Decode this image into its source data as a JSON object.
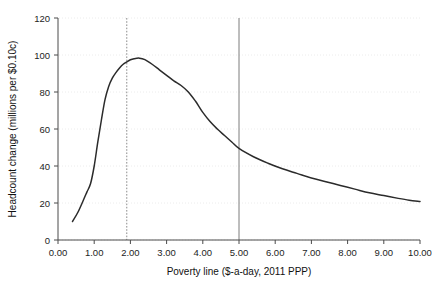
{
  "chart_data": {
    "type": "line",
    "title": "",
    "subtitle": "",
    "xlabel": "Poverty line ($-a-day, 2011 PPP)",
    "ylabel": "Headcount change  (millions per $0.10c)",
    "xlim": [
      0.0,
      10.0
    ],
    "ylim": [
      0,
      120
    ],
    "xticks": [
      0.0,
      1.0,
      2.0,
      3.0,
      4.0,
      5.0,
      6.0,
      7.0,
      8.0,
      9.0,
      10.0
    ],
    "xtick_labels": [
      "0.00",
      "1.00",
      "2.00",
      "3.00",
      "4.00",
      "5.00",
      "6.00",
      "7.00",
      "8.00",
      "9.00",
      "10.00"
    ],
    "yticks": [
      0,
      20,
      40,
      60,
      80,
      100,
      120
    ],
    "ytick_labels": [
      "0",
      "20",
      "40",
      "60",
      "80",
      "100",
      "120"
    ],
    "grid": "horizontal-dotted",
    "legend": "none",
    "line_color": "#2b2b2b",
    "series": [
      {
        "name": "Headcount change",
        "x": [
          0.4,
          0.55,
          0.7,
          0.8,
          0.9,
          1.0,
          1.1,
          1.2,
          1.3,
          1.4,
          1.5,
          1.6,
          1.7,
          1.8,
          1.9,
          2.0,
          2.1,
          2.25,
          2.4,
          2.6,
          2.8,
          3.0,
          3.2,
          3.4,
          3.6,
          3.8,
          3.9,
          4.0,
          4.2,
          4.4,
          4.6,
          4.8,
          5.0,
          5.4,
          5.8,
          6.2,
          6.6,
          7.0,
          7.4,
          7.8,
          8.2,
          8.6,
          9.0,
          9.4,
          9.7,
          10.0
        ],
        "y": [
          10.0,
          15.0,
          21.5,
          26.0,
          30.5,
          40.0,
          53.0,
          65.0,
          76.0,
          83.0,
          87.5,
          90.5,
          93.0,
          95.0,
          96.3,
          97.4,
          98.0,
          98.3,
          97.5,
          95.0,
          92.0,
          89.0,
          86.0,
          83.5,
          80.0,
          75.0,
          72.0,
          69.0,
          64.0,
          60.0,
          56.5,
          53.0,
          49.5,
          45.0,
          41.5,
          38.5,
          36.0,
          33.5,
          31.5,
          29.5,
          27.5,
          25.5,
          24.0,
          22.5,
          21.5,
          20.8
        ]
      }
    ],
    "reference_lines": [
      {
        "name": "poverty-line-1.90",
        "x": 1.9,
        "style": "dotted",
        "color": "#8c8c8c"
      },
      {
        "name": "poverty-line-5.00",
        "x": 5.0,
        "style": "solid",
        "color": "#7d7d7d"
      }
    ],
    "annotations": []
  }
}
